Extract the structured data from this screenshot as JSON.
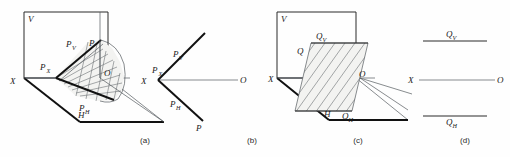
{
  "figure": {
    "background_color": "#fefefe",
    "line_color": "#2b2b2b",
    "hatch_color": "#6b7074",
    "thin_color": "#555a5e"
  },
  "panels": [
    {
      "id": "a",
      "caption": "(a)",
      "labels": {
        "plane_v": "V",
        "plane_h": "H",
        "axis_x": "X",
        "axis_o": "O",
        "trace_v": "P",
        "trace_v_sub": "V",
        "trace_h": "P",
        "trace_h_sub": "H",
        "point_px": "P",
        "point_px_sub": "X",
        "point_p": "P"
      }
    },
    {
      "id": "b",
      "caption": "(b)",
      "labels": {
        "axis_x": "X",
        "axis_o": "O",
        "trace_v": "P",
        "trace_v_sub": "V",
        "trace_h": "P",
        "trace_h_sub": "H",
        "point_px": "P",
        "point_px_sub": "X",
        "point_p": "P"
      }
    },
    {
      "id": "c",
      "caption": "(c)",
      "labels": {
        "plane_v": "V",
        "plane_h": "H",
        "axis_x": "X",
        "axis_o": "O",
        "trace_v": "Q",
        "trace_v_sub": "V",
        "trace_h": "Q",
        "trace_h_sub": "H",
        "point_q": "Q"
      }
    },
    {
      "id": "d",
      "caption": "(d)",
      "labels": {
        "axis_x": "X",
        "axis_o": "O",
        "trace_v": "Q",
        "trace_v_sub": "V",
        "trace_h": "Q",
        "trace_h_sub": "H"
      }
    }
  ]
}
